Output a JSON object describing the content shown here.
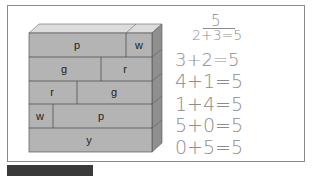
{
  "wall": {
    "rows": [
      {
        "bricks": [
          {
            "label": "p"
          },
          {
            "label": "w"
          }
        ]
      },
      {
        "bricks": [
          {
            "label": "g"
          },
          {
            "label": "r"
          }
        ]
      },
      {
        "bricks": [
          {
            "label": "r"
          },
          {
            "label": "g"
          }
        ]
      },
      {
        "bricks": [
          {
            "label": "w"
          },
          {
            "label": "p"
          }
        ]
      },
      {
        "bricks": [
          {
            "label": "y"
          }
        ]
      }
    ],
    "colors": {
      "front": "#b4b4b4",
      "top": "#dcdcdc",
      "side": "#8f8f8f",
      "edge": "#555555"
    }
  },
  "equations": {
    "total": "5",
    "lines": [
      "2+3=5",
      "3+2=5",
      "4+1=5",
      "1+4=5",
      "5+0=5",
      "0+5=5"
    ]
  }
}
